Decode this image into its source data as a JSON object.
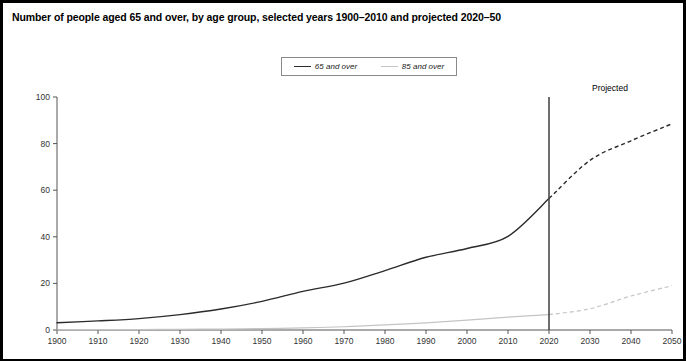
{
  "chart_data": {
    "type": "line",
    "title": "Number of people aged 65 and over, by age group, selected years 1900–2010 and projected 2020–50",
    "xlabel": "",
    "ylabel": "Millions",
    "xlim": [
      1900,
      2050
    ],
    "ylim": [
      0,
      100
    ],
    "grid": false,
    "legend_position": "top-center",
    "x_ticks": [
      "1900",
      "1910",
      "1920",
      "1930",
      "1940",
      "1950",
      "1960",
      "1970",
      "1980",
      "1990",
      "2000",
      "2010",
      "2020",
      "2030",
      "2040",
      "2050"
    ],
    "y_ticks": [
      "0",
      "20",
      "40",
      "60",
      "80",
      "100"
    ],
    "x": [
      1900,
      1910,
      1920,
      1930,
      1940,
      1950,
      1960,
      1970,
      1980,
      1990,
      2000,
      2010,
      2020,
      2030,
      2040,
      2050
    ],
    "projection_start_year": 2020,
    "projection_divider_label": "Projected",
    "series": [
      {
        "name": "65 and over",
        "color": "#2b2b2b",
        "values": [
          3.1,
          3.9,
          4.9,
          6.6,
          9.0,
          12.3,
          16.6,
          20.1,
          25.5,
          31.2,
          35.0,
          40.2,
          56.4,
          72.8,
          81.2,
          88.5
        ]
      },
      {
        "name": "85 and over",
        "color": "#c4c4c4",
        "values": [
          0.1,
          0.2,
          0.2,
          0.3,
          0.4,
          0.6,
          0.9,
          1.4,
          2.2,
          3.1,
          4.2,
          5.5,
          6.6,
          9.1,
          14.6,
          19.0
        ]
      }
    ]
  },
  "legend": {
    "items": [
      {
        "label": "65 and over"
      },
      {
        "label": "85 and over"
      }
    ]
  },
  "annotations": {
    "projected": "Projected"
  },
  "axes": {
    "y_title": "Millions"
  },
  "footnote": {
    "text": ""
  }
}
